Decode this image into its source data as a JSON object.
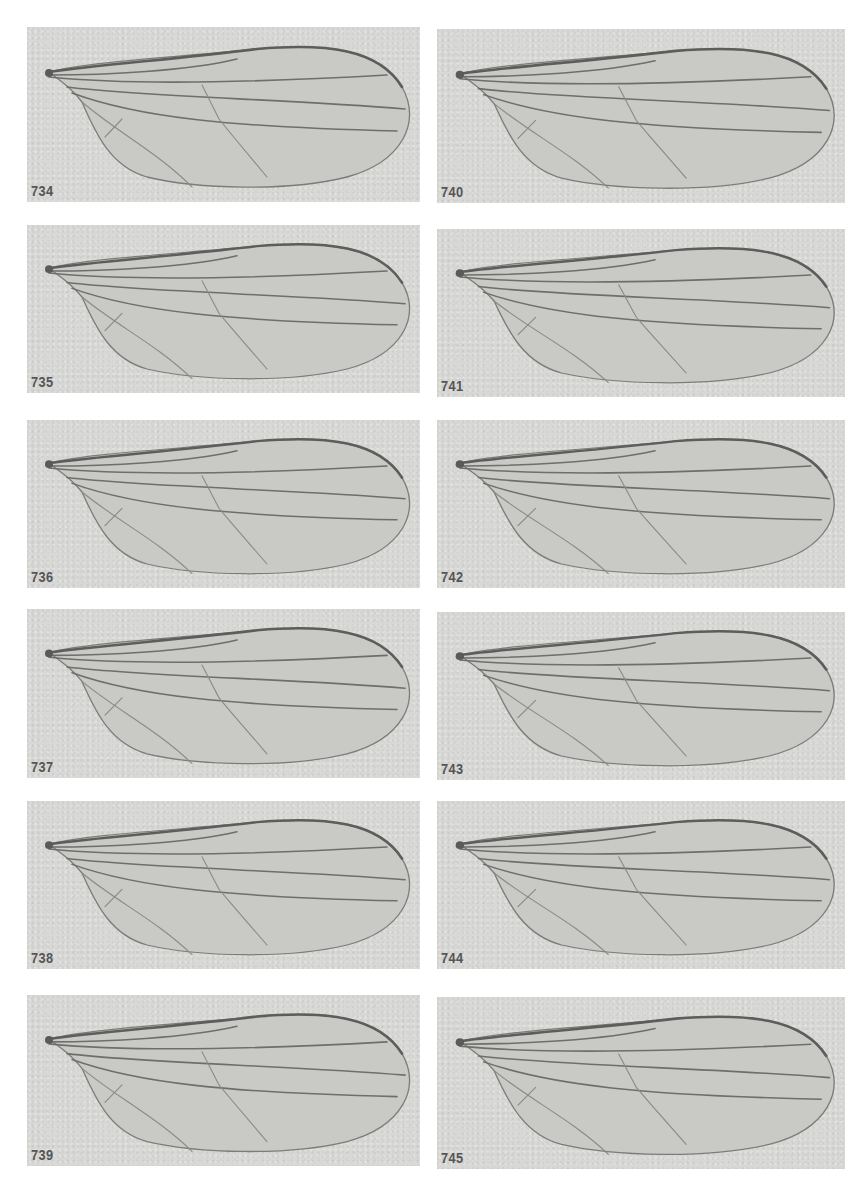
{
  "figure": {
    "colors": {
      "page": "#ffffff",
      "panel": "#d8d8d6",
      "vein": "#6e6e6c",
      "label": "#555555"
    }
  },
  "panels": [
    {
      "label": "734",
      "column": "left",
      "row": 1
    },
    {
      "label": "735",
      "column": "left",
      "row": 2
    },
    {
      "label": "736",
      "column": "left",
      "row": 3
    },
    {
      "label": "737",
      "column": "left",
      "row": 4
    },
    {
      "label": "738",
      "column": "left",
      "row": 5
    },
    {
      "label": "739",
      "column": "left",
      "row": 6
    },
    {
      "label": "740",
      "column": "right",
      "row": 1
    },
    {
      "label": "741",
      "column": "right",
      "row": 2
    },
    {
      "label": "742",
      "column": "right",
      "row": 3
    },
    {
      "label": "743",
      "column": "right",
      "row": 4
    },
    {
      "label": "744",
      "column": "right",
      "row": 5
    },
    {
      "label": "745",
      "column": "right",
      "row": 6
    }
  ]
}
